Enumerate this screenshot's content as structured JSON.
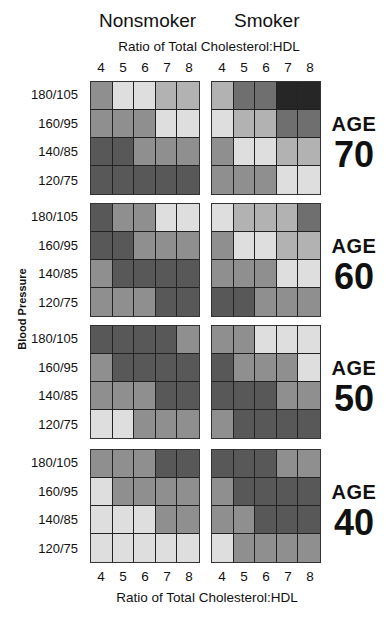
{
  "chart_data": {
    "type": "heatmap",
    "title": "",
    "column_groups": [
      "Nonsmoker",
      "Smoker"
    ],
    "xlabel": "Ratio of Total Cholesterol:HDL",
    "ylabel": "Blood Pressure",
    "x_ticks": [
      "4",
      "5",
      "6",
      "7",
      "8"
    ],
    "y_ticks": [
      "180/105",
      "160/95",
      "140/85",
      "120/75"
    ],
    "age_word": "AGE",
    "level_colors": {
      "1": "#dedede",
      "2": "#b2b2b2",
      "3": "#8f8f8f",
      "4": "#6f6f6f",
      "5": "#585858",
      "6": "#262626"
    },
    "panels": [
      {
        "age": "70",
        "nonsmoker": [
          [
            3,
            1,
            1,
            2,
            2
          ],
          [
            3,
            3,
            3,
            1,
            1
          ],
          [
            5,
            5,
            3,
            3,
            3
          ],
          [
            5,
            5,
            5,
            5,
            5
          ]
        ],
        "smoker": [
          [
            2,
            4,
            4,
            6,
            6
          ],
          [
            1,
            2,
            2,
            4,
            4
          ],
          [
            3,
            1,
            1,
            2,
            2
          ],
          [
            3,
            3,
            3,
            1,
            1
          ]
        ]
      },
      {
        "age": "60",
        "nonsmoker": [
          [
            5,
            3,
            3,
            1,
            1
          ],
          [
            5,
            5,
            3,
            3,
            3
          ],
          [
            3,
            5,
            5,
            5,
            5
          ],
          [
            3,
            3,
            3,
            5,
            5
          ]
        ],
        "smoker": [
          [
            1,
            2,
            2,
            2,
            4
          ],
          [
            3,
            1,
            1,
            2,
            2
          ],
          [
            3,
            3,
            3,
            1,
            1
          ],
          [
            5,
            5,
            3,
            3,
            3
          ]
        ]
      },
      {
        "age": "50",
        "nonsmoker": [
          [
            5,
            5,
            5,
            5,
            3
          ],
          [
            3,
            5,
            5,
            5,
            5
          ],
          [
            3,
            3,
            3,
            5,
            5
          ],
          [
            1,
            1,
            3,
            3,
            3
          ]
        ],
        "smoker": [
          [
            3,
            3,
            1,
            1,
            1
          ],
          [
            5,
            3,
            3,
            3,
            1
          ],
          [
            5,
            5,
            5,
            3,
            3
          ],
          [
            3,
            5,
            5,
            5,
            5
          ]
        ]
      },
      {
        "age": "40",
        "nonsmoker": [
          [
            3,
            3,
            3,
            5,
            5
          ],
          [
            1,
            3,
            3,
            3,
            3
          ],
          [
            1,
            1,
            1,
            3,
            3
          ],
          [
            1,
            1,
            1,
            1,
            1
          ]
        ],
        "smoker": [
          [
            5,
            5,
            5,
            3,
            3
          ],
          [
            3,
            5,
            5,
            5,
            5
          ],
          [
            3,
            3,
            5,
            5,
            5
          ],
          [
            1,
            3,
            3,
            3,
            3
          ]
        ]
      }
    ]
  }
}
